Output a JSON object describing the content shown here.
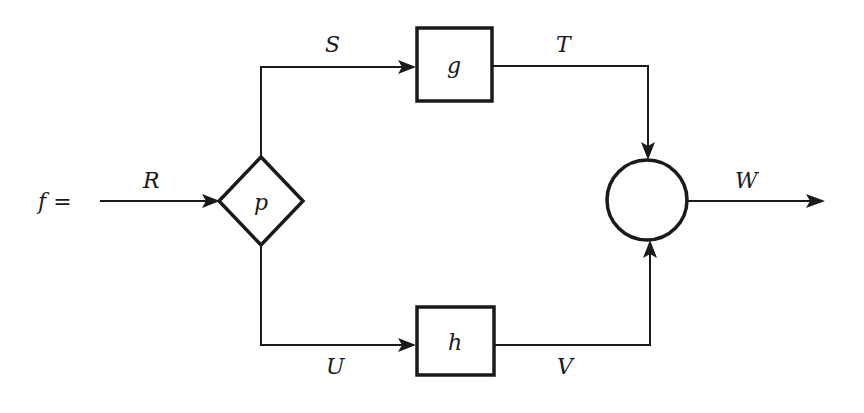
{
  "diagram": {
    "type": "block-diagram",
    "input_label": "f =",
    "colors": {
      "stroke": "#1a1a1a",
      "background": "#ffffff"
    },
    "nodes": [
      {
        "id": "p",
        "shape": "diamond",
        "label": "p"
      },
      {
        "id": "g",
        "shape": "box",
        "label": "g"
      },
      {
        "id": "h",
        "shape": "box",
        "label": "h"
      },
      {
        "id": "sum",
        "shape": "circle",
        "label": ""
      }
    ],
    "edges": [
      {
        "from": "input",
        "to": "p",
        "label": "R"
      },
      {
        "from": "p",
        "to": "g",
        "label": "S"
      },
      {
        "from": "g",
        "to": "sum",
        "label": "T"
      },
      {
        "from": "p",
        "to": "h",
        "label": "U"
      },
      {
        "from": "h",
        "to": "sum",
        "label": "V"
      },
      {
        "from": "sum",
        "to": "output",
        "label": "W"
      }
    ]
  }
}
